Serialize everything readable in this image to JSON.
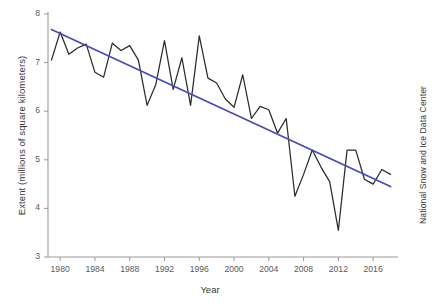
{
  "chart_data": {
    "type": "line",
    "title": "",
    "xlabel": "Year",
    "ylabel": "Extent (millions of square kilometers)",
    "credit": "National Snow and Ice Data Center",
    "xlim": [
      1978.6,
      2018.4
    ],
    "ylim": [
      3,
      8
    ],
    "grid": false,
    "legend_position": "none",
    "x_tick_labels": [
      "1980",
      "1984",
      "1988",
      "1992",
      "1996",
      "2000",
      "2004",
      "2008",
      "2012",
      "2016"
    ],
    "x_ticks": [
      1980,
      1984,
      1988,
      1992,
      1996,
      2000,
      2004,
      2008,
      2012,
      2016
    ],
    "y_tick_labels": [
      "3",
      "4",
      "5",
      "6",
      "7",
      "8"
    ],
    "y_ticks": [
      3,
      4,
      5,
      6,
      7,
      8
    ],
    "colors": {
      "series_line": "#2b2b2b",
      "trend_line": "#4a4ab8",
      "axis": "#9a9a9a",
      "text": "#3a3a3a"
    },
    "x": [
      1979,
      1980,
      1981,
      1982,
      1983,
      1984,
      1985,
      1986,
      1987,
      1988,
      1989,
      1990,
      1991,
      1992,
      1993,
      1994,
      1995,
      1996,
      1997,
      1998,
      1999,
      2000,
      2001,
      2002,
      2003,
      2004,
      2005,
      2006,
      2007,
      2008,
      2009,
      2010,
      2011,
      2012,
      2013,
      2014,
      2015,
      2016,
      2017,
      2018
    ],
    "series": [
      {
        "name": "September Arctic sea ice extent",
        "type": "line",
        "color": "#2b2b2b",
        "values": [
          7.05,
          7.63,
          7.17,
          7.3,
          7.38,
          6.8,
          6.7,
          7.4,
          7.25,
          7.35,
          7.05,
          6.12,
          6.55,
          7.45,
          6.45,
          7.1,
          6.12,
          7.55,
          6.68,
          6.58,
          6.25,
          6.08,
          6.75,
          5.85,
          6.1,
          6.03,
          5.55,
          5.85,
          4.25,
          4.7,
          5.2,
          4.85,
          4.55,
          3.55,
          5.2,
          5.2,
          4.6,
          4.5,
          4.8,
          4.7
        ]
      },
      {
        "name": "Linear trend",
        "type": "line",
        "color": "#4a4ab8",
        "x_endpoints": [
          1979,
          2018
        ],
        "y_endpoints": [
          7.68,
          4.45
        ]
      }
    ]
  },
  "axes": {
    "y_title": "Extent (millions of square kilometers)",
    "x_title": "Year"
  },
  "credit_text": "National Snow and Ice Data Center"
}
